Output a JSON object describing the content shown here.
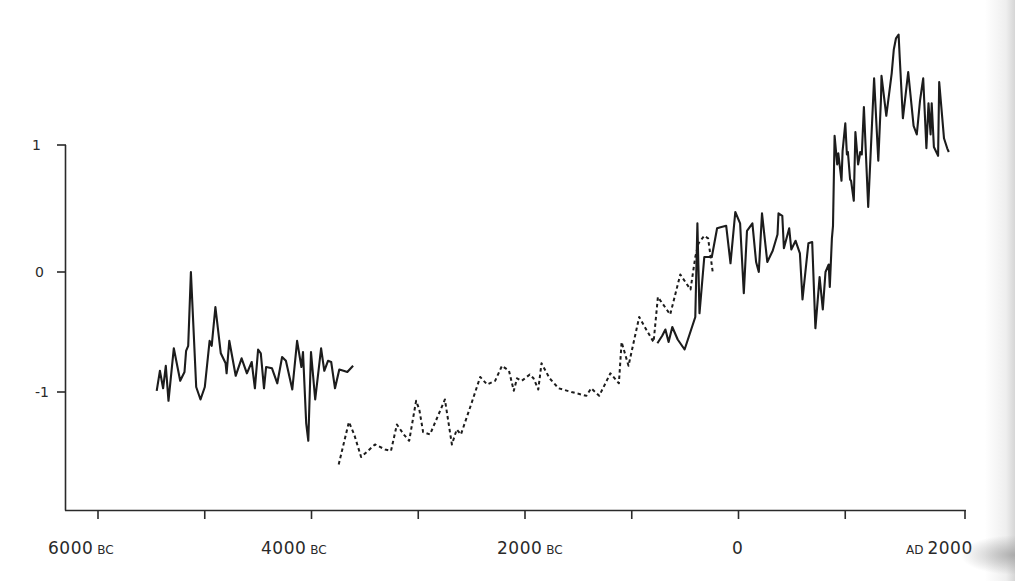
{
  "chart_data": {
    "type": "line",
    "title": "",
    "xlabel": "",
    "ylabel": "",
    "x_tick_labels": [
      "6000 BC",
      "4000 BC",
      "2000 BC",
      "0",
      "AD 2000"
    ],
    "x_ticks_years": [
      -6000,
      -5000,
      -4000,
      -3000,
      -2000,
      -1000,
      0,
      1000,
      2000
    ],
    "y_tick_labels": [
      "1",
      "0",
      "-1"
    ],
    "y_ticks": [
      1,
      0,
      -1
    ],
    "xlim": [
      -6330,
      2000
    ],
    "ylim": [
      -1.9,
      1.0
    ],
    "grid": false,
    "legend": null,
    "series": [
      {
        "name": "series-1-early-solid",
        "style": "solid",
        "x": [
          -5450,
          -5420,
          -5390,
          -5365,
          -5340,
          -5290,
          -5230,
          -5190,
          -5175,
          -5155,
          -5130,
          -5080,
          -5040,
          -5000,
          -4955,
          -4935,
          -4900,
          -4850,
          -4805,
          -4795,
          -4770,
          -4710,
          -4655,
          -4605,
          -4560,
          -4530,
          -4500,
          -4475,
          -4445,
          -4425,
          -4370,
          -4320,
          -4275,
          -4240,
          -4180,
          -4135,
          -4095,
          -4080,
          -4050,
          -4030,
          -4005,
          -3965,
          -3910,
          -3880,
          -3845,
          -3815,
          -3780,
          -3740,
          -3700,
          -3665,
          -3610
        ],
        "values": [
          -0.95,
          -0.79,
          -0.93,
          -0.75,
          -1.03,
          -0.61,
          -0.87,
          -0.8,
          -0.63,
          -0.59,
          0.0,
          -0.92,
          -1.02,
          -0.92,
          -0.55,
          -0.59,
          -0.28,
          -0.65,
          -0.73,
          -0.81,
          -0.55,
          -0.83,
          -0.69,
          -0.81,
          -0.72,
          -0.93,
          -0.62,
          -0.65,
          -0.93,
          -0.76,
          -0.77,
          -0.89,
          -0.68,
          -0.71,
          -0.94,
          -0.55,
          -0.76,
          -0.64,
          -1.21,
          -1.35,
          -0.64,
          -1.02,
          -0.61,
          -0.79,
          -0.71,
          -0.72,
          -0.93,
          -0.78,
          -0.79,
          -0.8,
          -0.75
        ]
      },
      {
        "name": "series-2-dashed",
        "style": "dashed",
        "x": [
          -3745,
          -3650,
          -3600,
          -3535,
          -3405,
          -3310,
          -3255,
          -3200,
          -3135,
          -3085,
          -3020,
          -2990,
          -2955,
          -2890,
          -2750,
          -2685,
          -2640,
          -2600,
          -2505,
          -2420,
          -2355,
          -2280,
          -2215,
          -2150,
          -2105,
          -2075,
          -2030,
          -1955,
          -1920,
          -1875,
          -1845,
          -1770,
          -1685,
          -1565,
          -1425,
          -1380,
          -1305,
          -1200,
          -1120,
          -1095,
          -1030,
          -930,
          -865,
          -795,
          -755,
          -640,
          -545,
          -450,
          -405,
          -375,
          -320,
          -285,
          -240
        ],
        "values": [
          -1.54,
          -1.2,
          -1.3,
          -1.48,
          -1.38,
          -1.42,
          -1.43,
          -1.22,
          -1.3,
          -1.35,
          -1.03,
          -1.1,
          -1.28,
          -1.3,
          -1.02,
          -1.38,
          -1.26,
          -1.3,
          -1.06,
          -0.84,
          -0.9,
          -0.87,
          -0.75,
          -0.79,
          -0.95,
          -0.85,
          -0.87,
          -0.82,
          -0.85,
          -0.94,
          -0.73,
          -0.85,
          -0.93,
          -0.96,
          -0.99,
          -0.93,
          -0.99,
          -0.81,
          -0.89,
          -0.56,
          -0.75,
          -0.36,
          -0.46,
          -0.56,
          -0.2,
          -0.34,
          -0.02,
          -0.14,
          0.12,
          0.23,
          0.29,
          0.27,
          -0.01
        ]
      },
      {
        "name": "series-3-recent-solid",
        "style": "solid",
        "x": [
          -760,
          -715,
          -685,
          -655,
          -620,
          -570,
          -505,
          -405,
          -385,
          -365,
          -320,
          -250,
          -200,
          -160,
          -115,
          -75,
          -30,
          15,
          50,
          80,
          130,
          165,
          190,
          220,
          270,
          320,
          365,
          375,
          410,
          425,
          475,
          495,
          535,
          575,
          600,
          655,
          690,
          720,
          720,
          760,
          790,
          815,
          845,
          855,
          875,
          885,
          900,
          925,
          935,
          965,
          975,
          1000,
          1015,
          1025,
          1045,
          1055,
          1080,
          1095,
          1120,
          1135,
          1140,
          1155,
          1175,
          1215,
          1270,
          1310,
          1335,
          1340,
          1385,
          1435,
          1455,
          1475,
          1500,
          1510,
          1540,
          1590,
          1640,
          1670,
          1700,
          1720,
          1730,
          1760,
          1780,
          1800,
          1810,
          1830,
          1870,
          1880,
          1925,
          1955,
          1970
        ],
        "values": [
          -0.57,
          -0.51,
          -0.46,
          -0.56,
          -0.44,
          -0.54,
          -0.62,
          -0.36,
          0.39,
          -0.33,
          0.12,
          0.12,
          0.35,
          0.36,
          0.37,
          0.07,
          0.48,
          0.39,
          -0.17,
          0.33,
          0.39,
          0.08,
          0.0,
          0.47,
          0.08,
          0.17,
          0.3,
          0.47,
          0.45,
          0.19,
          0.35,
          0.18,
          0.25,
          0.15,
          -0.22,
          0.23,
          0.24,
          -0.45,
          -0.45,
          -0.04,
          -0.3,
          0.0,
          0.06,
          -0.12,
          0.27,
          0.37,
          1.09,
          0.86,
          0.95,
          0.73,
          0.97,
          1.19,
          0.94,
          0.96,
          0.74,
          0.73,
          0.57,
          1.12,
          0.86,
          0.93,
          0.96,
          0.94,
          1.32,
          0.52,
          1.55,
          0.89,
          1.39,
          1.57,
          1.25,
          1.59,
          1.78,
          1.87,
          1.9,
          1.72,
          1.23,
          1.6,
          1.17,
          1.1,
          1.37,
          1.49,
          1.55,
          0.99,
          1.35,
          1.1,
          1.35,
          1.0,
          0.93,
          1.52,
          1.07,
          0.99,
          0.96
        ]
      }
    ]
  },
  "axes": {
    "y_labels": [
      "1",
      "0",
      "-1"
    ],
    "x_labels": [
      {
        "num": "6000",
        "era": "BC"
      },
      {
        "num": "4000",
        "era": "BC"
      },
      {
        "num": "2000",
        "era": "BC"
      },
      {
        "num": "0",
        "era": ""
      },
      {
        "num": "2000",
        "era": "AD"
      }
    ]
  }
}
